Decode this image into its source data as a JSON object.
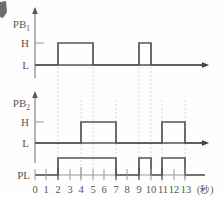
{
  "diagram": {
    "type": "timing-diagram",
    "unit_label": "(秒)",
    "level_high": "H",
    "level_low": "L",
    "time_axis": {
      "ticks": [
        "0",
        "1",
        "2",
        "3",
        "4",
        "5",
        "6",
        "7",
        "8",
        "9",
        "10",
        "11",
        "12",
        "13"
      ],
      "min": 0,
      "max": 13
    },
    "signals": [
      {
        "name": "PB1",
        "label": "PB",
        "subscript": "1",
        "levels": [
          "L",
          "H"
        ],
        "pulses": [
          {
            "start": 2,
            "end": 5
          },
          {
            "start": 9,
            "end": 10
          }
        ]
      },
      {
        "name": "PB2",
        "label": "PB",
        "subscript": "2",
        "levels": [
          "L",
          "H"
        ],
        "pulses": [
          {
            "start": 4,
            "end": 7
          },
          {
            "start": 11,
            "end": 13
          }
        ]
      },
      {
        "name": "PL",
        "label": "PL",
        "subscript": "",
        "pulses": [
          {
            "start": 2,
            "end": 7
          },
          {
            "start": 9,
            "end": 10
          },
          {
            "start": 11,
            "end": 13
          }
        ]
      }
    ],
    "guide_times": [
      2,
      4,
      5,
      7,
      9,
      10,
      11,
      13
    ],
    "colors": {
      "waveform": "#555555",
      "axis": "#555555",
      "guide": "#d8d8d8",
      "text": "#555555",
      "background": "#fefefe"
    }
  }
}
